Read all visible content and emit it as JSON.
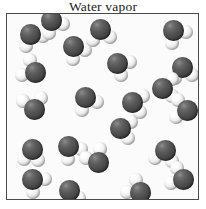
{
  "title": "Water vapor",
  "colors": {
    "background": "#ffffff",
    "box_background": "#fbfbfb",
    "box_border": "#4a4a4a",
    "oxygen": "#4a4a4a",
    "hydrogen": "#f2f2f2",
    "title_text": "#1a1a1a"
  },
  "box": {
    "x": 6,
    "y": 13,
    "width": 193,
    "height": 187
  },
  "legend": {
    "oxygen_label": "oxygen",
    "hydrogen_label": "hydrogen",
    "molecule_label": "water molecule"
  },
  "diagram": {
    "type": "particle-diagram",
    "phase": "gas",
    "substance": "water",
    "molecule_count": 22,
    "atom_radius": {
      "oxygen": 10.5,
      "hydrogen": 7
    },
    "molecules": [
      {
        "id": 1,
        "x": 23,
        "y": 20,
        "h1_angle": 10,
        "h2_angle": 108,
        "bond": 13
      },
      {
        "id": 2,
        "x": 66,
        "y": 32,
        "h1_angle": 18,
        "h2_angle": 92,
        "bond": 13
      },
      {
        "id": 3,
        "x": 93,
        "y": 15,
        "h1_angle": 40,
        "h2_angle": 122,
        "bond": 13
      },
      {
        "id": 4,
        "x": 166,
        "y": 16,
        "h1_angle": 8,
        "h2_angle": 96,
        "bond": 13
      },
      {
        "id": 5,
        "x": 110,
        "y": 49,
        "h1_angle": -5,
        "h2_angle": 70,
        "bond": 13
      },
      {
        "id": 6,
        "x": 175,
        "y": 53,
        "h1_angle": 38,
        "h2_angle": 125,
        "bond": 13
      },
      {
        "id": 7,
        "x": 28,
        "y": 58,
        "h1_angle": 168,
        "h2_angle": 248,
        "bond": 13
      },
      {
        "id": 8,
        "x": 155,
        "y": 74,
        "h1_angle": -42,
        "h2_angle": 38,
        "bond": 13
      },
      {
        "id": 9,
        "x": 78,
        "y": 83,
        "h1_angle": 24,
        "h2_angle": 104,
        "bond": 13
      },
      {
        "id": 10,
        "x": 27,
        "y": 95,
        "h1_angle": 216,
        "h2_angle": 300,
        "bond": 13
      },
      {
        "id": 11,
        "x": 180,
        "y": 96,
        "h1_angle": 150,
        "h2_angle": 228,
        "bond": 13
      },
      {
        "id": 12,
        "x": 113,
        "y": 114,
        "h1_angle": -28,
        "h2_angle": 52,
        "bond": 13
      },
      {
        "id": 13,
        "x": 25,
        "y": 135,
        "h1_angle": 128,
        "h2_angle": 62,
        "bond": 13
      },
      {
        "id": 14,
        "x": 61,
        "y": 132,
        "h1_angle": 12,
        "h2_angle": 88,
        "bond": 13
      },
      {
        "id": 15,
        "x": 158,
        "y": 136,
        "h1_angle": 58,
        "h2_angle": 140,
        "bond": 13
      },
      {
        "id": 16,
        "x": 91,
        "y": 148,
        "h1_angle": 196,
        "h2_angle": 278,
        "bond": 13
      },
      {
        "id": 17,
        "x": 176,
        "y": 165,
        "h1_angle": 160,
        "h2_angle": 240,
        "bond": 13
      },
      {
        "id": 18,
        "x": 25,
        "y": 165,
        "h1_angle": 0,
        "h2_angle": 84,
        "bond": 13
      },
      {
        "id": 19,
        "x": 62,
        "y": 176,
        "h1_angle": 40,
        "h2_angle": 122,
        "bond": 13
      },
      {
        "id": 20,
        "x": 133,
        "y": 178,
        "h1_angle": 178,
        "h2_angle": 254,
        "bond": 13
      },
      {
        "id": 21,
        "x": 125,
        "y": 88,
        "h1_angle": 330,
        "h2_angle": 50,
        "bond": 13
      },
      {
        "id": 22,
        "x": 44,
        "y": 6,
        "h1_angle": 20,
        "h2_angle": 100,
        "bond": 13
      }
    ]
  }
}
